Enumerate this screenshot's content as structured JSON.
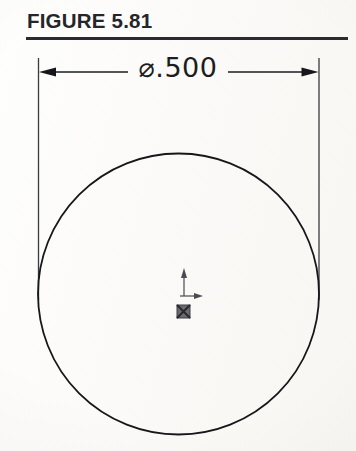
{
  "page": {
    "width": 356,
    "height": 451,
    "background_color": "#fdfdfc",
    "ink_color": "#1d1d21"
  },
  "header": {
    "title": "FIGURE 5.81",
    "rule_color": "#2b2b2f"
  },
  "drawing": {
    "type": "engineering-dimension-drawing",
    "subject": "circle",
    "dimension": {
      "label": "⌀.500",
      "symbol": "⌀",
      "symbol_name": "diameter-symbol",
      "value": ".500",
      "nominal_value": 0.5,
      "units": "inches",
      "line_style": "solid-with-arrowheads",
      "arrow_heads": [
        "left",
        "right"
      ],
      "line_y": 72,
      "extension_line_left_x": 38,
      "extension_line_right_x": 319
    },
    "circle": {
      "center_x": 178.5,
      "center_y": 294,
      "radius": 140.5,
      "stroke_color": "#17171b",
      "stroke_width": 1.8,
      "fill": "none"
    },
    "origin_marker": {
      "name": "cad-origin-triad",
      "x": 184,
      "y": 297,
      "y_axis_arrow": "up",
      "x_axis_arrow": "right",
      "base_glyph": "filled-square-with-x"
    }
  }
}
